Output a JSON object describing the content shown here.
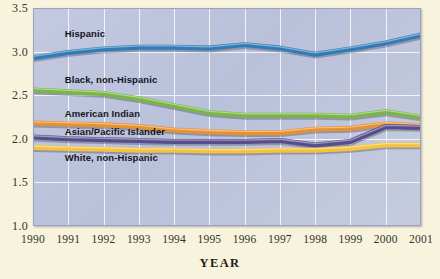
{
  "chart_data": {
    "type": "line",
    "title": "",
    "xlabel": "YEAR",
    "ylabel": "",
    "x": [
      1990,
      1991,
      1992,
      1993,
      1994,
      1995,
      1996,
      1997,
      1998,
      1999,
      2000,
      2001
    ],
    "xtick_labels": [
      "1990",
      "1991",
      "1992",
      "1993",
      "1994",
      "1995",
      "1996",
      "1997",
      "1998",
      "1999",
      "2000",
      "2001"
    ],
    "ytick_labels": [
      "1.0",
      "1.5",
      "2.0",
      "2.5",
      "3.0",
      "3.5"
    ],
    "yticks": [
      1.0,
      1.5,
      2.0,
      2.5,
      3.0,
      3.5
    ],
    "ylim": [
      1.0,
      3.5
    ],
    "xlim": [
      1990,
      2001
    ],
    "grid": true,
    "legend_position": "inline-labels",
    "series": [
      {
        "name": "Hispanic",
        "color": "#2f7cb6",
        "label_x": 1990.9,
        "label_y": 3.2,
        "values": [
          2.93,
          2.99,
          3.03,
          3.05,
          3.05,
          3.04,
          3.08,
          3.04,
          2.97,
          3.03,
          3.1,
          3.19
        ]
      },
      {
        "name": "Black, non-Hispanic",
        "color": "#79b644",
        "label_x": 1990.9,
        "label_y": 2.68,
        "values": [
          2.56,
          2.54,
          2.52,
          2.46,
          2.38,
          2.3,
          2.27,
          2.27,
          2.27,
          2.26,
          2.31,
          2.25
        ]
      },
      {
        "name": "American Indian",
        "color": "#e8912d",
        "label_x": 1990.9,
        "label_y": 2.29,
        "values": [
          2.18,
          2.17,
          2.16,
          2.14,
          2.1,
          2.08,
          2.07,
          2.07,
          2.11,
          2.12,
          2.17,
          2.15
        ]
      },
      {
        "name": "Asian/Pacific Islander",
        "color": "#574d8b",
        "label_x": 1990.9,
        "label_y": 2.08,
        "values": [
          2.02,
          2.0,
          1.99,
          1.98,
          1.97,
          1.97,
          1.97,
          1.98,
          1.93,
          1.97,
          2.14,
          2.13
        ]
      },
      {
        "name": "White, non-Hispanic",
        "color": "#f4c23c",
        "label_x": 1990.9,
        "label_y": 1.78,
        "values": [
          1.9,
          1.89,
          1.88,
          1.87,
          1.87,
          1.86,
          1.86,
          1.87,
          1.87,
          1.89,
          1.93,
          1.93
        ]
      }
    ]
  },
  "colors": {
    "page_background": "#f8f3dc",
    "plot_background": "#bfc6dc",
    "gridline": "#ffffff",
    "text": "#32322e"
  }
}
